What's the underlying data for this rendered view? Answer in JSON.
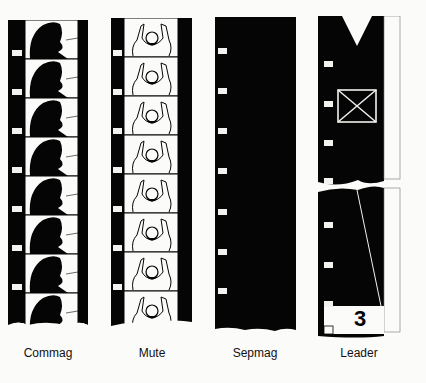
{
  "figure": {
    "strips": [
      {
        "id": "commag",
        "label": "Commag",
        "content": "woman-face-frames",
        "frames": 8
      },
      {
        "id": "mute",
        "label": "Mute",
        "content": "raised-hands-figure-frames",
        "frames": 8
      },
      {
        "id": "sepmag",
        "label": "Sepmag",
        "content": "solid-black-with-sprockets"
      },
      {
        "id": "leader",
        "label": "Leader",
        "content": "leader-with-countdown",
        "countdown_number": "3"
      }
    ],
    "colors": {
      "film": "#050505",
      "paper": "#fbfbf9",
      "sprocket": "#f2f2ee"
    }
  }
}
